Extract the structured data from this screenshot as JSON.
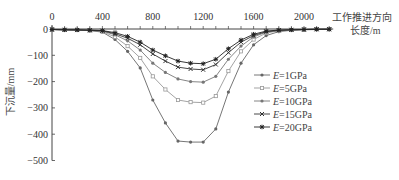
{
  "chart_data": {
    "type": "line",
    "title": "",
    "xlabel": "工作推进方向长度/m",
    "xlabel_lines": [
      "工作推进方向",
      "长度/m"
    ],
    "ylabel": "下沉量/mm",
    "xlim": [
      0,
      2200
    ],
    "ylim": [
      -500,
      0
    ],
    "x_ticks": [
      0,
      400,
      800,
      1200,
      1600,
      2000
    ],
    "y_ticks": [
      0,
      -100,
      -200,
      -300,
      -400,
      -500
    ],
    "grid": false,
    "legend_position": "right-middle",
    "x": [
      0,
      100,
      200,
      300,
      400,
      500,
      600,
      700,
      800,
      900,
      1000,
      1100,
      1200,
      1300,
      1400,
      1500,
      1600,
      1700,
      1800,
      1900,
      2000,
      2100,
      2200
    ],
    "series": [
      {
        "name": "E=1GPa",
        "marker": "dot",
        "values": [
          -2,
          -3,
          -4,
          -6,
          -12,
          -40,
          -85,
          -148,
          -270,
          -357,
          -426,
          -430,
          -430,
          -380,
          -240,
          -130,
          -60,
          -25,
          -10,
          -5,
          -3,
          -2,
          -1
        ]
      },
      {
        "name": "E=5GPa",
        "marker": "open-square",
        "values": [
          -2,
          -3,
          -4,
          -6,
          -10,
          -30,
          -65,
          -110,
          -180,
          -230,
          -270,
          -278,
          -280,
          -255,
          -160,
          -85,
          -40,
          -15,
          -7,
          -4,
          -2,
          -1,
          -1
        ]
      },
      {
        "name": "E=10GPa",
        "marker": "dot",
        "values": [
          -2,
          -3,
          -4,
          -5,
          -8,
          -22,
          -45,
          -80,
          -130,
          -165,
          -190,
          -200,
          -202,
          -180,
          -115,
          -65,
          -30,
          -12,
          -6,
          -3,
          -2,
          -1,
          -1
        ]
      },
      {
        "name": "E=15GPa",
        "marker": "x",
        "values": [
          -2,
          -3,
          -4,
          -5,
          -7,
          -18,
          -35,
          -60,
          -95,
          -122,
          -145,
          -152,
          -155,
          -135,
          -90,
          -50,
          -25,
          -10,
          -5,
          -3,
          -2,
          -1,
          -1
        ]
      },
      {
        "name": "E=20GPa",
        "marker": "star",
        "values": [
          -2,
          -3,
          -3,
          -4,
          -6,
          -14,
          -28,
          -50,
          -80,
          -102,
          -122,
          -130,
          -132,
          -115,
          -75,
          -42,
          -20,
          -8,
          -4,
          -3,
          -2,
          -1,
          -1
        ]
      }
    ]
  }
}
